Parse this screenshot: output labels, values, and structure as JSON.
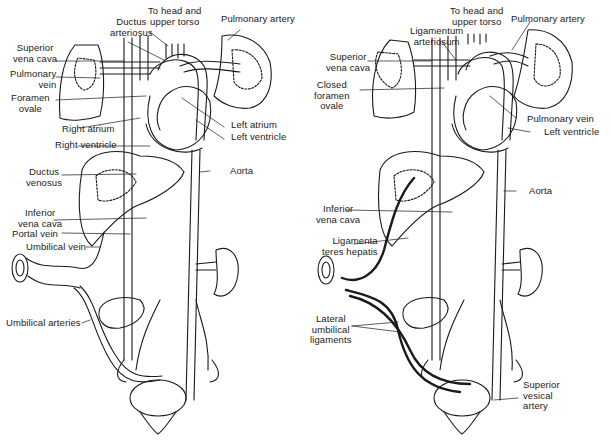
{
  "figure": {
    "panels": [
      {
        "id": "fetal",
        "labels": {
          "superior_vena_cava": "Superior\nvena cava",
          "ductus_arteriosus": "Ductus\narteriosus",
          "to_head": "To head and\nupper torso",
          "pulmonary_artery": "Pulmonary artery",
          "pulmonary_vein": "Pulmonary\nvein",
          "foramen_ovale": "Foramen\novale",
          "right_atrium": "Right atrium",
          "right_ventricle": "Right ventricle",
          "left_atrium": "Left atrium",
          "left_ventricle": "Left ventricle",
          "ductus_venosus": "Ductus\nvenosus",
          "aorta": "Aorta",
          "inferior_vena_cava": "Inferior\nvena cava",
          "portal_vein": "Portal vein",
          "umbilical_vein": "Umbilical vein",
          "umbilical_arteries": "Umbilical arteries"
        }
      },
      {
        "id": "postnatal",
        "labels": {
          "to_head": "To head and\nupper torso",
          "ligamentum_arteriosum": "Ligamentum\narteriosum",
          "pulmonary_artery": "Pulmonary artery",
          "superior_vena_cava": "Superior\nvena cava",
          "closed_foramen_ovale": "Closed\nforamen\novale",
          "pulmonary_vein": "Pulmonary vein",
          "left_ventricle": "Left ventricle",
          "aorta": "Aorta",
          "inferior_vena_cava": "Inferior\nvena cava",
          "ligamenta_teres_hepatis": "Ligamenta\nteres hepatis",
          "lateral_umbilical_ligaments": "Lateral\numbilical\nligaments",
          "superior_vesical_artery": "Superior\nvesical\nartery"
        }
      }
    ]
  }
}
